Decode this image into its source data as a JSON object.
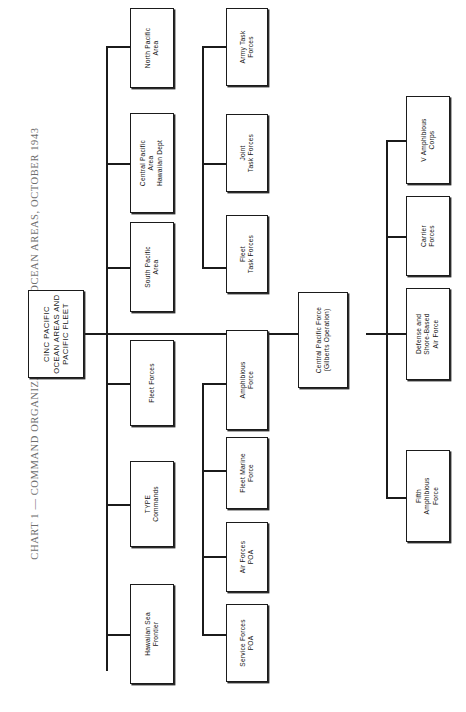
{
  "title": "CHART 1 — COMMAND ORGANIZATION, PACIFIC OCEAN AREAS, OCTOBER 1943",
  "diagram": {
    "type": "organization-chart",
    "orientation": "rotated-90-ccw",
    "root": {
      "id": "root",
      "label": "CINC PACIFIC\nOCEAN AREAS AND\nPACIFIC FLEET"
    },
    "columns": [
      {
        "name": "subordinate-commands",
        "nodes": [
          {
            "id": "north-pacific-area",
            "label": "North Pacific\nArea"
          },
          {
            "id": "central-pacific-area",
            "label": "Central Pacific\nArea\nHawaiian Dept"
          },
          {
            "id": "south-pacific-area",
            "label": "South Pacific\nArea"
          },
          {
            "id": "fleet-forces",
            "label": "Fleet Forces"
          },
          {
            "id": "type-commands",
            "label": "TYPE\nCommands"
          },
          {
            "id": "hawaiian-sea-frontier",
            "label": "Hawaiian Sea\nFrontier"
          }
        ]
      },
      {
        "name": "task-and-force-commands",
        "nodes": [
          {
            "id": "army-task-forces",
            "label": "Army Task\nForces"
          },
          {
            "id": "joint-task-forces",
            "label": "Joint\nTask Forces"
          },
          {
            "id": "fleet-task-forces",
            "label": "Fleet\nTask Forces"
          },
          {
            "id": "amphibious-force",
            "label": "Amphibious\nForce"
          },
          {
            "id": "fleet-marine-force",
            "label": "Fleet Marine\nForce"
          },
          {
            "id": "air-forces-poa",
            "label": "Air Forces\nPOA"
          },
          {
            "id": "service-forces-poa",
            "label": "Service Forces\nPOA"
          }
        ]
      },
      {
        "name": "operational-force",
        "nodes": [
          {
            "id": "central-pacific-force",
            "label": "Central Pacific Force\n(Gilberts Operation)"
          }
        ]
      },
      {
        "name": "gilberts-task-organization",
        "nodes": [
          {
            "id": "v-amphibious-corps",
            "label": "V Amphibious\nCorps"
          },
          {
            "id": "carrier-forces",
            "label": "Carrier\nForces"
          },
          {
            "id": "defense-shore-air",
            "label": "Defense and\nShore-Based\nAir Force"
          },
          {
            "id": "fifth-amphibious-force",
            "label": "Fifth\nAmphibious\nForce"
          }
        ]
      }
    ]
  }
}
